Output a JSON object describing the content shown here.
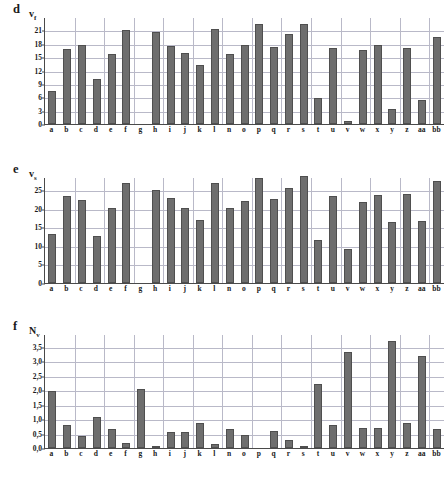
{
  "figure": {
    "background": "#ffffff",
    "bar_color": "#6e6e6e",
    "grid_color": "#b9b9c8",
    "axis_color": "#4a4a4a"
  },
  "panels": [
    {
      "letter": "d",
      "axis_symbol": "v",
      "axis_subscript": "f"
    },
    {
      "letter": "e",
      "axis_symbol": "v",
      "axis_subscript": "s"
    },
    {
      "letter": "f",
      "axis_symbol": "N",
      "axis_subscript": "v"
    }
  ],
  "chart_data": [
    {
      "type": "bar",
      "panel": "d",
      "title": "",
      "xlabel": "",
      "ylabel": "v_f",
      "ylim": [
        0,
        24
      ],
      "yticks": [
        0,
        3,
        6,
        9,
        12,
        15,
        18,
        21
      ],
      "ytick_labels": [
        "0",
        "3",
        "6",
        "9",
        "12",
        "15",
        "18",
        "21"
      ],
      "grid": true,
      "legend": "none",
      "categories": [
        "a",
        "b",
        "c",
        "d",
        "e",
        "f",
        "g",
        "h",
        "i",
        "j",
        "k",
        "l",
        "n",
        "o",
        "p",
        "q",
        "r",
        "s",
        "t",
        "u",
        "v",
        "w",
        "x",
        "y",
        "z",
        "aa",
        "bb"
      ],
      "values": [
        7.4,
        16.8,
        17.8,
        10.2,
        15.8,
        21.1,
        0,
        20.6,
        17.5,
        16.0,
        13.3,
        21.2,
        15.7,
        17.7,
        22.5,
        17.2,
        20.3,
        22.5,
        5.9,
        17.0,
        0.7,
        16.5,
        17.7,
        3.4,
        17.1,
        5.4,
        19.6
      ]
    },
    {
      "type": "bar",
      "panel": "e",
      "title": "",
      "xlabel": "",
      "ylabel": "v_s",
      "ylim": [
        0,
        28.5
      ],
      "yticks": [
        0,
        5,
        10,
        15,
        20,
        25
      ],
      "ytick_labels": [
        "0",
        "5",
        "10",
        "15",
        "20",
        "25"
      ],
      "grid": true,
      "legend": "none",
      "categories": [
        "a",
        "b",
        "c",
        "d",
        "e",
        "f",
        "g",
        "h",
        "i",
        "j",
        "k",
        "l",
        "n",
        "o",
        "p",
        "q",
        "r",
        "s",
        "t",
        "u",
        "v",
        "w",
        "x",
        "y",
        "z",
        "aa",
        "bb"
      ],
      "values": [
        13.2,
        23.3,
        22.3,
        12.6,
        20.3,
        26.9,
        0,
        25.0,
        22.8,
        20.1,
        16.9,
        26.9,
        20.1,
        22.1,
        28.3,
        22.5,
        25.5,
        28.7,
        11.6,
        23.5,
        9.2,
        21.8,
        23.6,
        16.3,
        23.9,
        16.8,
        27.3
      ]
    },
    {
      "type": "bar",
      "panel": "f",
      "title": "",
      "xlabel": "",
      "ylabel": "N_v",
      "ylim": [
        0,
        3.95
      ],
      "yticks": [
        0.0,
        0.5,
        1.0,
        1.5,
        2.0,
        2.5,
        3.0,
        3.5
      ],
      "ytick_labels": [
        "0,0",
        "0,5",
        "1,0",
        "1,5",
        "2,0",
        "2,5",
        "3,0",
        "3,5"
      ],
      "grid": true,
      "legend": "none",
      "categories": [
        "a",
        "b",
        "c",
        "d",
        "e",
        "f",
        "g",
        "h",
        "i",
        "j",
        "k",
        "l",
        "n",
        "o",
        "p",
        "q",
        "r",
        "s",
        "t",
        "u",
        "v",
        "w",
        "x",
        "y",
        "z",
        "aa",
        "bb"
      ],
      "values": [
        1.98,
        0.81,
        0.43,
        1.09,
        0.65,
        0.19,
        2.03,
        0.08,
        0.57,
        0.56,
        0.86,
        0.15,
        0.65,
        0.44,
        0.0,
        0.58,
        0.29,
        0.05,
        2.21,
        0.81,
        3.34,
        0.69,
        0.68,
        3.71,
        0.85,
        3.18,
        0.66
      ]
    }
  ]
}
